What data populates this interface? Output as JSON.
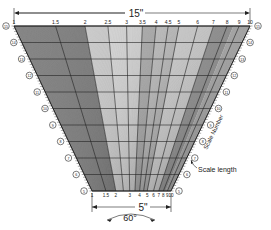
{
  "figure": {
    "top_dimension_label": "15\"",
    "bottom_dimension_label": "5\"",
    "angle_label": "60°",
    "scale_length_label": "Scale length",
    "scale_number_label": "Scale Number"
  },
  "geometry": {
    "top": {
      "y": 26,
      "x_left": 14,
      "x_right": 250
    },
    "bottom": {
      "y": 191,
      "x_left": 92,
      "x_right": 171
    }
  },
  "top_scale": {
    "labels": [
      "1",
      "1.5",
      "2",
      "2.5",
      "3",
      "3.5",
      "4",
      "4.5",
      "5",
      "6",
      "7",
      "8",
      "9",
      "10"
    ],
    "values": [
      1,
      1.5,
      2,
      2.5,
      3,
      3.5,
      4,
      4.5,
      5,
      6,
      7,
      8,
      9,
      10
    ]
  },
  "bottom_scale": {
    "labels": [
      "1",
      "1.5",
      "2",
      "3",
      "4",
      "5",
      "6",
      "7",
      "8",
      "9",
      "10"
    ],
    "values": [
      1,
      1.5,
      2,
      3,
      4,
      5,
      6,
      7,
      8,
      9,
      10
    ]
  },
  "scale_numbers": [
    "15",
    "14",
    "13",
    "12",
    "11",
    "10",
    "9",
    "8",
    "7",
    "6",
    "5"
  ],
  "colors": {
    "ink": "#222222",
    "fill_dark": "#6e6e6e",
    "fill_mid": "#a8a8a8",
    "fill_light": "#d9d9d9",
    "background": "#ffffff"
  }
}
